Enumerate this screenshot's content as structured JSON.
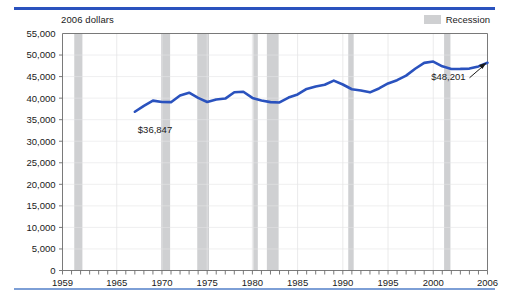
{
  "units_label": "2006 dollars",
  "legend": {
    "swatch_name": "recession-swatch",
    "label": "Recession",
    "color": "#cfd0d2"
  },
  "colors": {
    "line": "#2a52be",
    "rule_top": "#2a52be",
    "rule_bottom": "#7d9fd6",
    "recession_band": "#cfd0d2",
    "gridline": "#e4e4e6",
    "axis": "#6b6b6b"
  },
  "annotations": {
    "start_value": "$36,847",
    "end_value": "$48,201"
  },
  "chart_data": {
    "type": "line",
    "title": "",
    "subtitle": "",
    "xlabel": "",
    "ylabel": "2006 dollars",
    "grid": true,
    "legend_position": "top-right",
    "xlim": [
      1959,
      2006
    ],
    "ylim": [
      0,
      55000
    ],
    "ytick_labels": [
      "0",
      "5,000",
      "10,000",
      "15,000",
      "20,000",
      "25,000",
      "30,000",
      "35,000",
      "40,000",
      "45,000",
      "50,000",
      "55,000"
    ],
    "yticks": [
      0,
      5000,
      10000,
      15000,
      20000,
      25000,
      30000,
      35000,
      40000,
      45000,
      50000,
      55000
    ],
    "xtick_labels": [
      "1959",
      "1965",
      "1970",
      "1975",
      "1980",
      "1985",
      "1990",
      "1995",
      "2000",
      "2006"
    ],
    "xticks_labeled": [
      1959,
      1965,
      1970,
      1975,
      1980,
      1985,
      1990,
      1995,
      2000,
      2006
    ],
    "xticks_minor_step": 1,
    "series": [
      {
        "name": "Median household income",
        "color": "#2a52be",
        "x": [
          1967,
          1968,
          1969,
          1970,
          1971,
          1972,
          1973,
          1974,
          1975,
          1976,
          1977,
          1978,
          1979,
          1980,
          1981,
          1982,
          1983,
          1984,
          1985,
          1986,
          1987,
          1988,
          1989,
          1990,
          1991,
          1992,
          1993,
          1994,
          1995,
          1996,
          1997,
          1998,
          1999,
          2000,
          2001,
          2002,
          2003,
          2004,
          2005,
          2006
        ],
        "values": [
          36847,
          38224,
          39428,
          39098,
          39063,
          40624,
          41261,
          40059,
          39114,
          39694,
          39898,
          41367,
          41473,
          40059,
          39441,
          39080,
          39002,
          40129,
          40863,
          42134,
          42711,
          43107,
          44055,
          43160,
          42059,
          41775,
          41345,
          42249,
          43403,
          44161,
          45219,
          46821,
          48189,
          48484,
          47376,
          46772,
          46784,
          46854,
          47363,
          48201
        ]
      }
    ],
    "recessions": [
      {
        "start": 1960.3,
        "end": 1961.2
      },
      {
        "start": 1969.9,
        "end": 1970.9
      },
      {
        "start": 1973.9,
        "end": 1975.2
      },
      {
        "start": 1980.1,
        "end": 1980.6
      },
      {
        "start": 1981.6,
        "end": 1982.9
      },
      {
        "start": 1990.6,
        "end": 1991.2
      },
      {
        "start": 2001.2,
        "end": 2001.9
      }
    ],
    "annotations": [
      {
        "text": "$36,847",
        "x": 1967,
        "y": 36847,
        "placement": "below-left"
      },
      {
        "text": "$48,201",
        "x": 2006,
        "y": 48201,
        "placement": "below-left-arrow"
      }
    ]
  }
}
